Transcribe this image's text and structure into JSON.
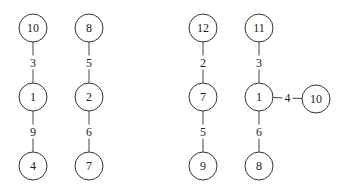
{
  "diagram": {
    "type": "weighted-trees",
    "nodes": [
      {
        "id": "a10",
        "label": "10",
        "x": 33,
        "y": 28
      },
      {
        "id": "a1",
        "label": "1",
        "x": 33,
        "y": 97
      },
      {
        "id": "a4",
        "label": "4",
        "x": 33,
        "y": 166
      },
      {
        "id": "b8",
        "label": "8",
        "x": 89,
        "y": 28
      },
      {
        "id": "b2",
        "label": "2",
        "x": 89,
        "y": 97
      },
      {
        "id": "b7",
        "label": "7",
        "x": 89,
        "y": 166
      },
      {
        "id": "c12",
        "label": "12",
        "x": 203,
        "y": 28
      },
      {
        "id": "c7",
        "label": "7",
        "x": 203,
        "y": 97
      },
      {
        "id": "c9",
        "label": "9",
        "x": 203,
        "y": 166
      },
      {
        "id": "d11",
        "label": "11",
        "x": 259,
        "y": 28
      },
      {
        "id": "d1",
        "label": "1",
        "x": 259,
        "y": 97
      },
      {
        "id": "d8",
        "label": "8",
        "x": 259,
        "y": 166
      },
      {
        "id": "d10",
        "label": "10",
        "x": 316,
        "y": 99
      }
    ],
    "edges": [
      {
        "from": "a10",
        "to": "a1",
        "weight": "3"
      },
      {
        "from": "a1",
        "to": "a4",
        "weight": "9"
      },
      {
        "from": "b8",
        "to": "b2",
        "weight": "5"
      },
      {
        "from": "b2",
        "to": "b7",
        "weight": "6"
      },
      {
        "from": "c12",
        "to": "c7",
        "weight": "2"
      },
      {
        "from": "c7",
        "to": "c9",
        "weight": "5"
      },
      {
        "from": "d11",
        "to": "d1",
        "weight": "3"
      },
      {
        "from": "d1",
        "to": "d8",
        "weight": "6"
      },
      {
        "from": "d1",
        "to": "d10",
        "weight": "4"
      }
    ]
  }
}
